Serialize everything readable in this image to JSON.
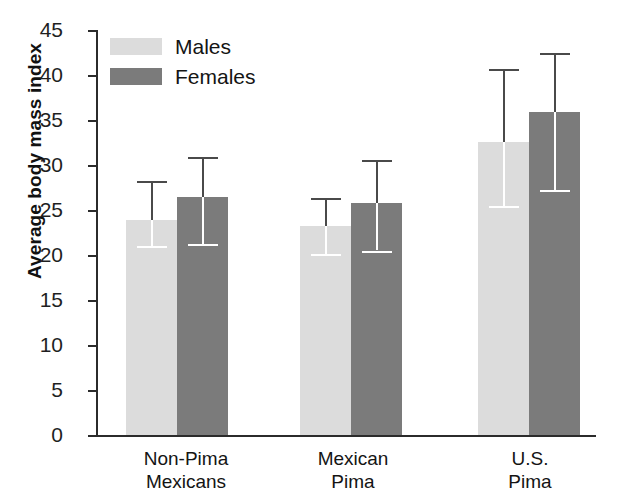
{
  "chart_data": {
    "type": "bar",
    "title": "",
    "xlabel": "",
    "ylabel": "Average body mass index",
    "ylim": [
      0,
      45
    ],
    "yticks": [
      0,
      5,
      10,
      15,
      20,
      25,
      30,
      35,
      40,
      45
    ],
    "grid": false,
    "legend_position": "top-left",
    "error_bars": "min-max whiskers drawn above and below each bar top",
    "categories": [
      "Non-Pima Mexicans",
      "Mexican Pima",
      "U.S. Pima"
    ],
    "series": [
      {
        "name": "Males",
        "color": "#dcdcdc",
        "values": [
          23.9,
          23.2,
          32.6
        ],
        "err_high": [
          28.2,
          26.3,
          40.7
        ],
        "err_low": [
          21.0,
          20.1,
          25.4
        ]
      },
      {
        "name": "Females",
        "color": "#7b7b7b",
        "values": [
          26.4,
          25.8,
          35.9
        ],
        "err_high": [
          30.9,
          30.6,
          42.5
        ],
        "err_low": [
          21.2,
          20.5,
          27.2
        ]
      }
    ]
  },
  "axes": {
    "y_title": "Average body mass index",
    "tick_labels": [
      "45",
      "40",
      "35",
      "30",
      "25",
      "20",
      "15",
      "10",
      "5",
      "0"
    ],
    "category_labels": [
      {
        "line1": "Non-Pima",
        "line2": "Mexicans"
      },
      {
        "line1": "Mexican",
        "line2": "Pima"
      },
      {
        "line1": "U.S.",
        "line2": "Pima"
      }
    ]
  },
  "legend": {
    "items": [
      {
        "label": "Males",
        "color": "#dcdcdc"
      },
      {
        "label": "Females",
        "color": "#7b7b7b"
      }
    ]
  },
  "caption_remnant": ""
}
